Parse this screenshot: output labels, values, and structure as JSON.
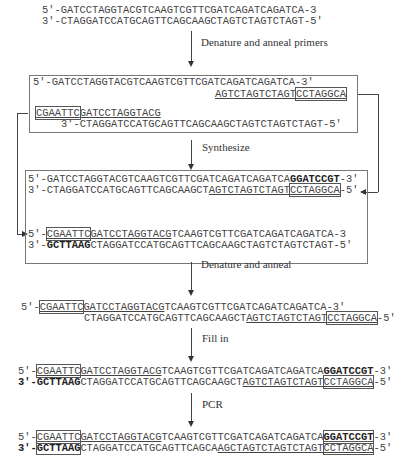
{
  "steps": {
    "step1": "Denature and anneal primers",
    "step2": "Synthesize",
    "step3": "Denature and anneal",
    "step4": "Fill in",
    "step5": "PCR"
  },
  "template": {
    "top": {
      "p5": "5′-",
      "seq": "GATCCTAGGTACGTCAAGTCGTTCGATCAGATCAGATCA",
      "p3": "-3"
    },
    "bottom": {
      "p3": "3′-",
      "seq": "CTAGGATCCATGCAGTTCAGCAAGCTAGTCTAGTCTAGT",
      "p5": "-5′"
    }
  },
  "annealed": {
    "top": {
      "p5": "5′-",
      "seq": "GATCCTAGGTACGTCAAGTCGTTCGATCAGATCAGATCA",
      "p3": "-3′"
    },
    "primer_right": {
      "anneal": "AGTCTAGTCTAGT",
      "tail": "CCTAGGCA"
    },
    "primer_left": {
      "tail": "CGAATTC",
      "anneal": "GATCCTAGGTACG"
    },
    "bottom": {
      "p3": "3′-",
      "seq": "CTAGGATCCATGCAGTTCAGCAAGCTAGTCTAGTCTAGT",
      "p5": "-5′"
    }
  },
  "synthesized": {
    "a_top": {
      "p5": "5′-",
      "seq": "GATCCTAGGTACGTCAAGTCGTTCGATCAGATCAGATCA",
      "ext": "GGATCCGT",
      "p3": "-3′"
    },
    "a_bottom": {
      "p3": "3′-",
      "pre": "CTAGGATCCATGCAGTTCAGCAAGCT",
      "anneal": "AGTCTAGTCTAGT",
      "tail": "CCTAGGCA",
      "p5": "-5′"
    },
    "b_top": {
      "p5": "5′-",
      "tail": "CGAATTC",
      "anneal": "GATCCTAGGTACG",
      "rest": "TCAAGTCGTTCGATCAGATCAGATCA",
      "p3": "-3"
    },
    "b_bottom": {
      "p3": "3′-",
      "ext": "GCTTAAG",
      "seq": "CTAGGATCCATGCAGTTCAGCAAGCTAGTCTAGTCTAGT",
      "p5": "-5′"
    }
  },
  "reannealed": {
    "top": {
      "p5": "5′-",
      "tail": "CGAATTC",
      "anneal": "GATCCTAGGTACG",
      "rest": "TCAAGTCGTTCGATCAGATCAGATCA",
      "p3": "-3′"
    },
    "bottom": {
      "pre": "CTAGGATCCATGCAGTTCAGCAAGCT",
      "anneal": "AGTCTAGTCTAGT",
      "tail": "CCTAGGCA",
      "p5": "-5′"
    }
  },
  "filled": {
    "top": {
      "p5": "5′-",
      "tail": "CGAATTC",
      "anneal": "GATCCTAGGTACG",
      "rest": "TCAAGTCGTTCGATCAGATCAGATCA",
      "ext": "GGATCCGT",
      "p3": "-3′"
    },
    "bottom": {
      "p3": "3′-",
      "ext": "GCTTAAG",
      "pre": "CTAGGATCCATGCAGTTCAGCAAGCT",
      "anneal": "AGTCTAGTCTAGT",
      "tail": "CCTAGGCA",
      "p5": "-5′"
    }
  },
  "pcr": {
    "top": {
      "p5": "5′-",
      "tail": "CGAATTC",
      "anneal": "GATCCTAGGTACG",
      "rest": "TCAAGTCGTTCGATCAGATCAGATCA",
      "ext": "GGATCCGT",
      "p3": "-3′"
    },
    "bottom": {
      "p3": "3′-",
      "ext": "GCTTAAG",
      "pre": "CTAGGATCCATGCAGTTCAGCA",
      "anneal": "AGCTAGTCTAGTCTAGT",
      "tail": "CCTAGGCA",
      "p5": "-5′"
    }
  }
}
